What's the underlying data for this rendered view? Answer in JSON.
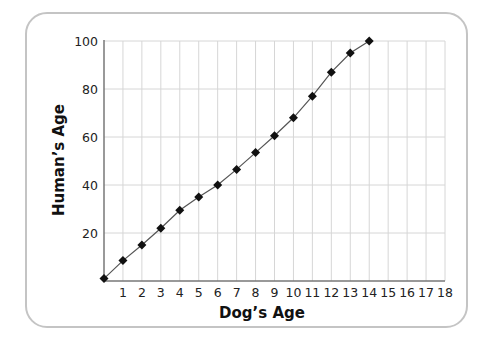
{
  "chart_data": {
    "type": "line",
    "title": "",
    "xlabel": "Dog’s Age",
    "ylabel": "Human’s Age",
    "x": [
      0,
      1,
      2,
      3,
      4,
      5,
      6,
      7,
      8,
      9,
      10,
      11,
      12,
      13,
      14
    ],
    "series": [
      {
        "name": "Human's Age",
        "values": [
          1,
          8.5,
          15,
          22,
          29.5,
          35,
          40,
          46.5,
          53.5,
          60.5,
          68,
          77,
          87,
          95,
          100
        ],
        "marker": "diamond",
        "color": "#111111",
        "line_color": "#555555"
      }
    ],
    "xlim": [
      0,
      18
    ],
    "ylim": [
      0,
      100
    ],
    "x_ticks": [
      "1",
      "2",
      "3",
      "4",
      "5",
      "6",
      "7",
      "8",
      "9",
      "10",
      "11",
      "12",
      "13",
      "14",
      "15",
      "16",
      "17",
      "18"
    ],
    "y_ticks": [
      "20",
      "40",
      "60",
      "80",
      "100"
    ],
    "grid": true,
    "legend": "none"
  },
  "colors": {
    "grid": "#d6d6d6",
    "axis": "#777777",
    "frame": "#c4c4c4",
    "marker": "#111111"
  }
}
